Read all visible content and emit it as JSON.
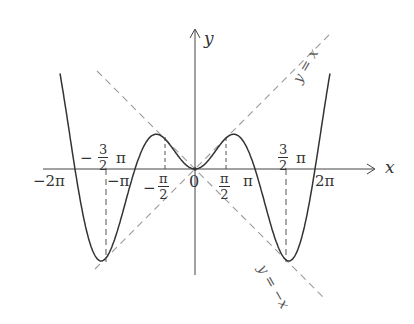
{
  "figure": {
    "axis_labels": {
      "x": "x",
      "y": "y",
      "origin": "0"
    },
    "asymptote_labels": {
      "y_eq_x": "y = x",
      "y_eq_neg_x": "y = −x"
    },
    "ticks": {
      "neg_two_pi": "−2π",
      "neg_pi": "−π",
      "pi": "π",
      "two_pi": "2π",
      "neg_three_half_pi": {
        "sign": "−",
        "num": "3",
        "den": "2",
        "pi": "π"
      },
      "three_half_pi": {
        "num": "3",
        "den": "2",
        "pi": "π"
      },
      "neg_half_pi": {
        "sign": "−",
        "num": "π",
        "den": "2"
      },
      "half_pi": {
        "num": "π",
        "den": "2"
      }
    },
    "colors": {
      "curve": "#333333",
      "axis": "#444444",
      "dashed": "#999999"
    }
  },
  "chart_data": {
    "type": "line",
    "title": "",
    "function": "y = x sin x",
    "xlabel": "x",
    "ylabel": "y",
    "x_ticks": [
      "−2π",
      "−3π/2",
      "−π",
      "−π/2",
      "0",
      "π/2",
      "π",
      "3π/2",
      "2π"
    ],
    "series": [
      {
        "name": "y = x sin x",
        "style": "solid"
      },
      {
        "name": "y = x",
        "style": "dashed"
      },
      {
        "name": "y = −x",
        "style": "dashed"
      }
    ],
    "key_points": [
      {
        "x": "−3π/2",
        "y": "−3π/2",
        "note": "tangent to y = −x... touches y = x line"
      },
      {
        "x": "−π/2",
        "y": "π/2",
        "note": "local max, touches y = −x"
      },
      {
        "x": "0",
        "y": "0"
      },
      {
        "x": "π/2",
        "y": "π/2",
        "note": "local max, touches y = x"
      },
      {
        "x": "3π/2",
        "y": "−3π/2",
        "note": "touches y = −x"
      }
    ],
    "zeros": [
      "−2π",
      "−π",
      "0",
      "π",
      "2π"
    ],
    "grid": false
  }
}
